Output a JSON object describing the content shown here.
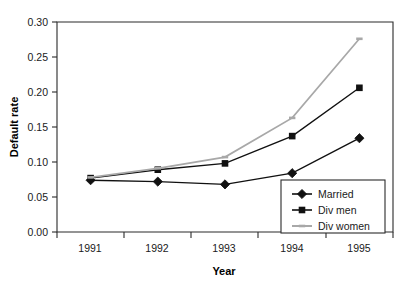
{
  "chart_data": {
    "type": "line",
    "title": "",
    "xlabel": "Year",
    "ylabel": "Default rate",
    "categories": [
      "1991",
      "1992",
      "1993",
      "1994",
      "1995"
    ],
    "x": [
      1991,
      1992,
      1993,
      1994,
      1995
    ],
    "ylim": [
      0.0,
      0.3
    ],
    "ytick_labels": [
      "0.00",
      "0.05",
      "0.10",
      "0.15",
      "0.20",
      "0.25",
      "0.30"
    ],
    "ytick_values": [
      0.0,
      0.05,
      0.1,
      0.15,
      0.2,
      0.25,
      0.3
    ],
    "grid": false,
    "legend_position": "bottom-right",
    "series": [
      {
        "name": "Married",
        "marker": "diamond",
        "color": "#111111",
        "values": [
          0.074,
          0.072,
          0.068,
          0.084,
          0.134
        ]
      },
      {
        "name": "Div men",
        "marker": "square",
        "color": "#111111",
        "values": [
          0.077,
          0.089,
          0.098,
          0.137,
          0.206
        ]
      },
      {
        "name": "Div women",
        "marker": "dash",
        "color": "#a8a8a8",
        "values": [
          0.078,
          0.091,
          0.107,
          0.163,
          0.276
        ]
      }
    ]
  },
  "axes": {
    "y_title": "Default rate",
    "x_title": "Year",
    "y_ticks": [
      "0.30",
      "0.25",
      "0.20",
      "0.15",
      "0.10",
      "0.05",
      "0.00"
    ],
    "x_ticks": [
      "1991",
      "1992",
      "1993",
      "1994",
      "1995"
    ]
  },
  "legend": {
    "entries": [
      {
        "label": "Married"
      },
      {
        "label": "Div men"
      },
      {
        "label": "Div women"
      }
    ]
  },
  "colors": {
    "married": "#111111",
    "div_men": "#111111",
    "div_women": "#a8a8a8",
    "axis": "#2b2b2b",
    "background": "#ffffff"
  }
}
